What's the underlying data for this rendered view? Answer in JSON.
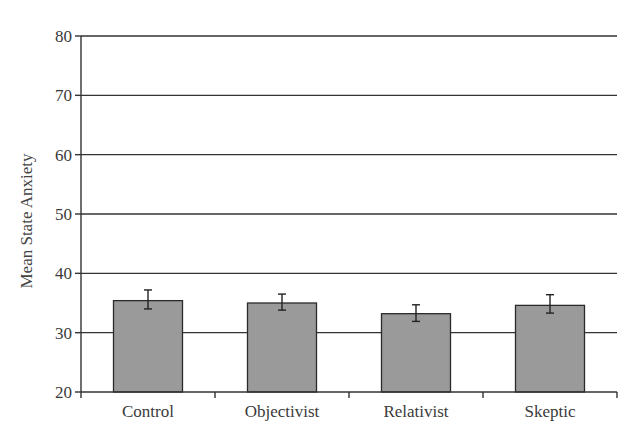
{
  "chart_data": {
    "type": "bar",
    "title": "",
    "xlabel": "",
    "ylabel": "Mean State Anxiety",
    "categories": [
      "Control",
      "Objectivist",
      "Relativist",
      "Skeptic"
    ],
    "values": [
      35.4,
      35.0,
      33.2,
      34.6
    ],
    "error_bars": {
      "upper": [
        37.2,
        36.5,
        34.7,
        36.4
      ],
      "lower": [
        34.0,
        33.8,
        31.9,
        33.3
      ]
    },
    "ylim": [
      20,
      80
    ],
    "yticks": [
      20,
      30,
      40,
      50,
      60,
      70,
      80
    ],
    "grid": true,
    "legend": null,
    "bar_color": "#9a9a9a"
  }
}
